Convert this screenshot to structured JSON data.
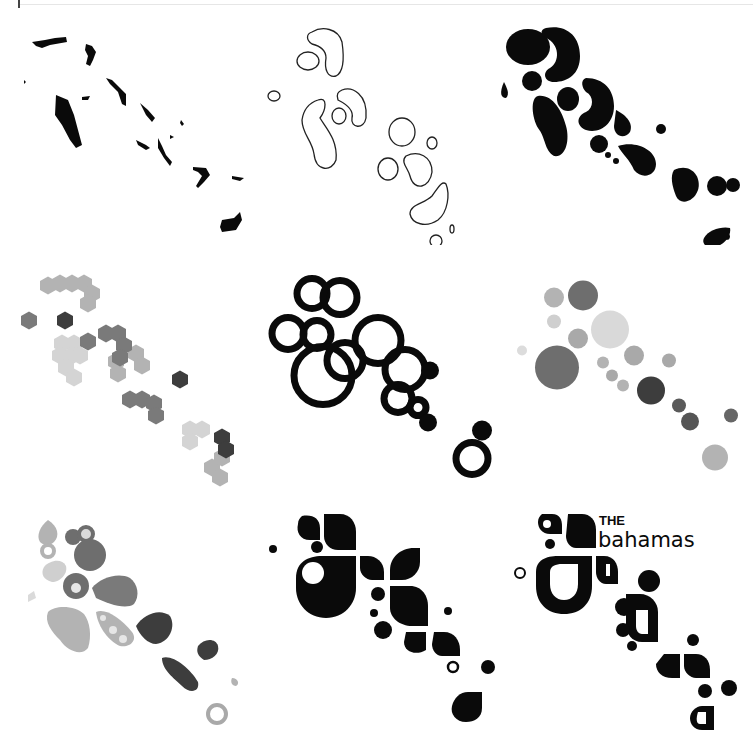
{
  "sheet": {
    "title": "Bahamas logo concept exploration",
    "layout": "3x3 grid",
    "panels": [
      {
        "id": "p1",
        "label": "Map silhouette",
        "style": "solid black islands"
      },
      {
        "id": "p2",
        "label": "Outline sketch",
        "style": "thin line blobs"
      },
      {
        "id": "p3",
        "label": "Ink blobs",
        "style": "solid black organic shapes"
      },
      {
        "id": "p4",
        "label": "Hexagon clusters",
        "style": "grey hexagons"
      },
      {
        "id": "p5",
        "label": "Ring circles",
        "style": "black rings"
      },
      {
        "id": "p6",
        "label": "Grey dots",
        "style": "grey filled circles"
      },
      {
        "id": "p7",
        "label": "Grey cloud shapes",
        "style": "grey organic shapes"
      },
      {
        "id": "p8",
        "label": "Petal mark",
        "style": "black petals and dots"
      },
      {
        "id": "p9",
        "label": "Final logo",
        "style": "black petals with wordmark"
      }
    ]
  },
  "logo": {
    "the": "THE",
    "name": "bahamas"
  },
  "colors": {
    "black": "#0a0a0a",
    "dark_grey": "#3d3d3d",
    "mid_grey": "#6e6e6e",
    "light_grey": "#a9a9a9",
    "pale_grey": "#cfcfcf",
    "background": "#ffffff"
  }
}
